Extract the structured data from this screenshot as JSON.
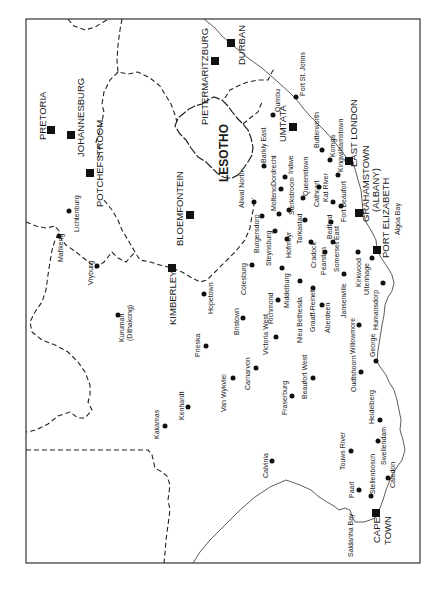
{
  "map": {
    "region_label": "LESOTHO",
    "major_cities": [
      {
        "name": "PRETORIA",
        "x": 51,
        "y": 130,
        "lx": 46,
        "ly": 130
      },
      {
        "name": "JOHANNESBURG",
        "x": 71,
        "y": 135,
        "lx": 84,
        "ly": 118
      },
      {
        "name": "POTCHEFSTROOM",
        "x": 90,
        "y": 173,
        "lx": 103,
        "ly": 140
      },
      {
        "name": "PIETERMARITZBURG",
        "x": 215,
        "y": 61,
        "lx": 208,
        "ly": 65
      },
      {
        "name": "DURBAN",
        "x": 231,
        "y": 43,
        "lx": 246,
        "ly": 40
      },
      {
        "name": "UMTATA",
        "x": 293,
        "y": 127,
        "lx": 286,
        "ly": 125
      },
      {
        "name": "EAST LONDON",
        "x": 349,
        "y": 161,
        "lx": 357,
        "ly": 140
      },
      {
        "name": "GRAHAMSTOWN",
        "x": 359,
        "y": 213,
        "lx": 371,
        "ly": 185
      },
      {
        "name": "(ALBANY)",
        "lx": 381,
        "ly": 185
      },
      {
        "name": "PORT ELIZABETH",
        "x": 377,
        "y": 250,
        "lx": 389,
        "ly": 222
      },
      {
        "name": "BLOEMFONTEIN",
        "x": 190,
        "y": 215,
        "lx": 182,
        "ly": 213
      },
      {
        "name": "KIMBERLEY",
        "x": 172,
        "y": 268,
        "lx": 176,
        "ly": 290
      },
      {
        "name": "CAPE",
        "x": 376,
        "y": 513,
        "lx": 380,
        "ly": 540
      },
      {
        "name": "TOWN",
        "lx": 391,
        "ly": 540
      }
    ],
    "towns": [
      {
        "name": "Lichtenburg",
        "x": 69,
        "y": 211,
        "lx": 78,
        "ly": 195
      },
      {
        "name": "Mafikeng",
        "x": 59,
        "y": 236,
        "lx": 62,
        "ly": 258
      },
      {
        "name": "Vryburg",
        "x": 97,
        "y": 266,
        "lx": 92,
        "ly": 280
      },
      {
        "name": "Kuruman",
        "x": 118,
        "y": 315,
        "lx": 122,
        "ly": 328
      },
      {
        "name": "(Dithakong)",
        "lx": 132,
        "ly": 328
      },
      {
        "name": "Hopetown",
        "x": 204,
        "y": 294,
        "lx": 212,
        "ly": 312
      },
      {
        "name": "Prieska",
        "x": 206,
        "y": 346,
        "lx": 200,
        "ly": 352
      },
      {
        "name": "Kenhardt",
        "x": 188,
        "y": 407,
        "lx": 183,
        "ly": 410
      },
      {
        "name": "Kakamas",
        "x": 165,
        "y": 426,
        "lx": 159,
        "ly": 430
      },
      {
        "name": "Qumbu",
        "x": 273,
        "y": 115,
        "lx": 280,
        "ly": 100
      },
      {
        "name": "Port St. Johns",
        "x": 296,
        "y": 97,
        "lx": 305,
        "ly": 92
      },
      {
        "name": "Barkly East",
        "x": 264,
        "y": 166,
        "lx": 265,
        "ly": 155
      },
      {
        "name": "Butterworth",
        "x": 322,
        "y": 150,
        "lx": 318,
        "ly": 140
      },
      {
        "name": "Komga",
        "x": 330,
        "y": 160,
        "lx": 335,
        "ly": 145
      },
      {
        "name": "Kingwilliamstown",
        "x": 338,
        "y": 175,
        "lx": 345,
        "ly": 150
      },
      {
        "name": "Dordrecht",
        "x": 281,
        "y": 189,
        "lx": 275,
        "ly": 180
      },
      {
        "name": "Indwe",
        "x": 285,
        "y": 177,
        "lx": 292,
        "ly": 165
      },
      {
        "name": "Queenstown",
        "x": 303,
        "y": 198,
        "lx": 306,
        "ly": 180
      },
      {
        "name": "Aliwal North",
        "x": 254,
        "y": 202,
        "lx": 240,
        "ly": 195
      },
      {
        "name": "Molteno",
        "x": 279,
        "y": 214,
        "lx": 275,
        "ly": 210
      },
      {
        "name": "Sterkstroom",
        "x": 289,
        "y": 210,
        "lx": 293,
        "ly": 200
      },
      {
        "name": "Cathcart",
        "x": 319,
        "y": 187,
        "lx": 313,
        "ly": 185
      },
      {
        "name": "Kat River",
        "x": 333,
        "y": 202,
        "lx": 327,
        "ly": 190
      },
      {
        "name": "Fort Beaufort",
        "x": 341,
        "y": 206,
        "lx": 346,
        "ly": 200
      },
      {
        "name": "Burgersdorp",
        "x": 262,
        "y": 216,
        "lx": 257,
        "ly": 213
      },
      {
        "name": "Tarkastad",
        "x": 305,
        "y": 220,
        "lx": 300,
        "ly": 215
      },
      {
        "name": "Bedford",
        "x": 331,
        "y": 222,
        "lx": 328,
        "ly": 220
      },
      {
        "name": "Steynsburg",
        "x": 275,
        "y": 231,
        "lx": 270,
        "ly": 233
      },
      {
        "name": "Hofmeyr",
        "x": 287,
        "y": 239,
        "lx": 292,
        "ly": 230
      },
      {
        "name": "Cradock",
        "x": 311,
        "y": 242,
        "lx": 316,
        "ly": 235
      },
      {
        "name": "Pearston",
        "x": 325,
        "y": 252,
        "lx": 323,
        "ly": 250
      },
      {
        "name": "Somerset East",
        "x": 333,
        "y": 242,
        "lx": 340,
        "ly": 250
      },
      {
        "name": "Colesburg",
        "x": 252,
        "y": 265,
        "lx": 244,
        "ly": 262
      },
      {
        "name": "Middelburg",
        "x": 282,
        "y": 268,
        "lx": 287,
        "ly": 275
      },
      {
        "name": "Kirkwood",
        "x": 358,
        "y": 252,
        "lx": 362,
        "ly": 265
      },
      {
        "name": "Uitenhage",
        "x": 372,
        "y": 258,
        "lx": 368,
        "ly": 268
      },
      {
        "name": "Humansdorp",
        "x": 383,
        "y": 283,
        "lx": 377,
        "ly": 303
      },
      {
        "name": "Jansenville",
        "x": 344,
        "y": 274,
        "lx": 339,
        "ly": 295
      },
      {
        "name": "Nieu Bethesda",
        "x": 300,
        "y": 281,
        "lx": 297,
        "ly": 310
      },
      {
        "name": "Graaff-Reinet",
        "x": 313,
        "y": 288,
        "lx": 309,
        "ly": 305
      },
      {
        "name": "Aberdeen",
        "x": 322,
        "y": 305,
        "lx": 327,
        "ly": 315
      },
      {
        "name": "Richmond",
        "x": 278,
        "y": 300,
        "lx": 271,
        "ly": 322
      },
      {
        "name": "Bristown",
        "x": 243,
        "y": 318,
        "lx": 240,
        "ly": 335
      },
      {
        "name": "Victoria West",
        "x": 276,
        "y": 337,
        "lx": 268,
        "ly": 350
      },
      {
        "name": "Willowmore",
        "x": 359,
        "y": 325,
        "lx": 354,
        "ly": 330
      },
      {
        "name": "George",
        "x": 376,
        "y": 361,
        "lx": 372,
        "ly": 343
      },
      {
        "name": "Oudtshoorn",
        "x": 361,
        "y": 372,
        "lx": 356,
        "ly": 380
      },
      {
        "name": "Carnarvon",
        "x": 256,
        "y": 368,
        "lx": 248,
        "ly": 373
      },
      {
        "name": "Van Wykvlei",
        "x": 233,
        "y": 378,
        "lx": 229,
        "ly": 392
      },
      {
        "name": "Beaufort West",
        "x": 313,
        "y": 378,
        "lx": 305,
        "ly": 385
      },
      {
        "name": "Fraserburg",
        "x": 292,
        "y": 396,
        "lx": 288,
        "ly": 410
      },
      {
        "name": "Heidelberg",
        "x": 380,
        "y": 420,
        "lx": 374,
        "ly": 425
      },
      {
        "name": "Swellendam",
        "x": 378,
        "y": 441,
        "lx": 384,
        "ly": 443
      },
      {
        "name": "Touws River",
        "x": 351,
        "y": 451,
        "lx": 345,
        "ly": 455
      },
      {
        "name": "Calvinia",
        "x": 272,
        "y": 461,
        "lx": 266,
        "ly": 470
      },
      {
        "name": "Caledon",
        "x": 388,
        "y": 478,
        "lx": 394,
        "ly": 470
      },
      {
        "name": "Paarl",
        "x": 359,
        "y": 490,
        "lx": 353,
        "ly": 500
      },
      {
        "name": "Stellenbosch",
        "x": 371,
        "y": 496,
        "lx": 377,
        "ly": 497
      },
      {
        "name": "Saldanha Bay",
        "lx": 350,
        "ly": 555
      },
      {
        "name": "Algoa Bay",
        "lx": 401,
        "ly": 215
      }
    ]
  }
}
